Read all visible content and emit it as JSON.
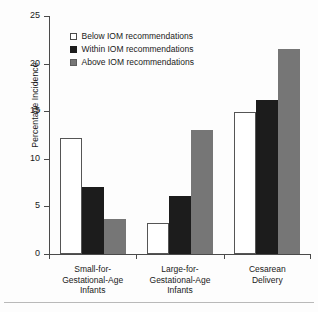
{
  "chart_data": {
    "type": "bar",
    "title": "",
    "xlabel": "",
    "ylabel": "Percentage Incidence",
    "ylim": [
      0,
      25
    ],
    "ytick_values": [
      0,
      5,
      10,
      15,
      20,
      25
    ],
    "ytick_labels": [
      "0",
      "5",
      "10",
      "15",
      "20",
      "25"
    ],
    "grid": false,
    "legend_position": "upper-left-inside",
    "categories": [
      "Small-for-Gestational-Age Infants",
      "Large-for-Gestational-Age Infants",
      "Cesarean Delivery"
    ],
    "category_label_lines": [
      [
        "Small-for-",
        "Gestational-Age",
        "Infants"
      ],
      [
        "Large-for-",
        "Gestational-Age",
        "Infants"
      ],
      [
        "Cesarean",
        "Delivery"
      ]
    ],
    "series": [
      {
        "name": "Below IOM recommendations",
        "color": "#ffffff",
        "edge_color": "#555555",
        "values": [
          12.2,
          3.3,
          14.9
        ]
      },
      {
        "name": "Within IOM recommendations",
        "color": "#1c1c1c",
        "edge_color": "#1c1c1c",
        "values": [
          7.0,
          6.1,
          16.2
        ]
      },
      {
        "name": "Above IOM recommendations",
        "color": "#767676",
        "edge_color": "#5d5d5d",
        "values": [
          3.7,
          13.0,
          21.5
        ]
      }
    ]
  },
  "legend": {
    "items": [
      {
        "label": "Below IOM recommendations",
        "swatch": "below"
      },
      {
        "label": "Within IOM recommendations",
        "swatch": "within"
      },
      {
        "label": "Above IOM recommendations",
        "swatch": "above"
      }
    ]
  },
  "axis": {
    "y_title": "Percentage Incidence"
  }
}
